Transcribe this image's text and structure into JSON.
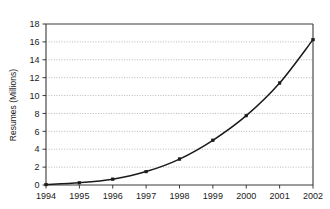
{
  "chart_data": {
    "type": "line",
    "title": "",
    "subtitle": "",
    "xlabel": "",
    "ylabel": "Resumes (Millions)",
    "categories": [
      "1994",
      "1995",
      "1996",
      "1997",
      "1998",
      "1999",
      "2000",
      "2001",
      "2002"
    ],
    "x": [
      1994,
      1995,
      1996,
      1997,
      1998,
      1999,
      2000,
      2001,
      2002
    ],
    "values": [
      0.05,
      0.25,
      0.65,
      1.5,
      2.9,
      5.0,
      7.75,
      11.4,
      16.25
    ],
    "series": [
      {
        "name": "Resumes",
        "values": [
          0.05,
          0.25,
          0.65,
          1.5,
          2.9,
          5.0,
          7.75,
          11.4,
          16.25
        ]
      }
    ],
    "xlim": [
      1994,
      2002
    ],
    "ylim": [
      0,
      18
    ],
    "yticks": [
      0,
      2,
      4,
      6,
      8,
      10,
      12,
      14,
      16,
      18
    ],
    "ytick_labels": [
      "0",
      "2",
      "4",
      "6",
      "8",
      "10",
      "12",
      "14",
      "16",
      "18"
    ],
    "xtick_labels": [
      "1994",
      "1995",
      "1996",
      "1997",
      "1998",
      "1999",
      "2000",
      "2001",
      "2002"
    ],
    "grid": true,
    "grid_axis": "y",
    "grid_style": "dotted",
    "legend": false,
    "legend_position": "none",
    "marker": "square",
    "line_color": "#1a1a1a",
    "grid_color": "#9a9a9a",
    "frame_color": "#3a3a3a",
    "background_color": "#ffffff"
  }
}
